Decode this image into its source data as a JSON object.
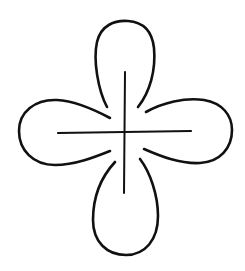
{
  "figure": {
    "stroke_color": "#111111",
    "background_color": "#ffffff",
    "petals": [
      {
        "name": "top",
        "path": "M107,107 C98,90 93,60 97,42 C101,25 115,20 128,21 C142,22 152,30 154,48 C156,70 150,92 138,107"
      },
      {
        "name": "right",
        "path": "M146,112 C162,103 185,97 204,100 C222,103 232,115 232,130 C232,148 220,162 200,163 C180,164 160,156 144,149"
      },
      {
        "name": "bottom",
        "path": "M140,159 C150,172 158,195 158,216 C158,240 145,255 126,255 C107,255 93,242 93,220 C93,195 103,175 115,162"
      },
      {
        "name": "left",
        "path": "M110,118 C95,110 75,101 57,100 C35,99 19,112 19,131 C19,150 33,165 55,165 C75,165 95,157 110,151"
      }
    ],
    "cross": {
      "vertical": {
        "x1": 125,
        "y1": 72,
        "x2": 124,
        "y2": 193
      },
      "horizontal": {
        "x1": 58,
        "y1": 133,
        "x2": 191,
        "y2": 131
      }
    }
  }
}
